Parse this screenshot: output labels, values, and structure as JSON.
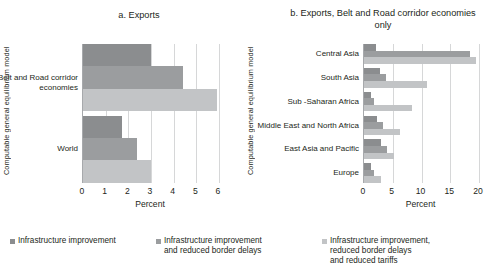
{
  "figure": {
    "yaxis_title": "Computable general equilibrium model"
  },
  "panels": [
    {
      "title": "a. Exports",
      "xlabel": "Percent",
      "ticks": [
        "0",
        "1",
        "2",
        "3",
        "4",
        "5",
        "6"
      ],
      "categories": [
        "Belt and\nRoad corridor\neconomies",
        "World"
      ]
    },
    {
      "title": "b. Exports, Belt and Road\ncorridor economies only",
      "xlabel": "Percent",
      "ticks": [
        "0",
        "5",
        "10",
        "15",
        "20"
      ],
      "categories": [
        "Central Asia",
        "South Asia",
        "Sub -Saharan  Africa",
        "Middle East\nand North Africa",
        "East Asia and Pacific",
        "Europe"
      ]
    }
  ],
  "legend": [
    {
      "label": "Infrastructure improvement",
      "color": "#8b8d8f"
    },
    {
      "label": "Infrastructure improvement\nand reduced border delays",
      "color": "#9b9d9f"
    },
    {
      "label": "Infrastructure improvement,\nreduced border delays\nand reduced tariffs",
      "color": "#c2c4c6"
    }
  ],
  "chart_data": [
    {
      "type": "bar",
      "orientation": "horizontal",
      "title": "a. Exports",
      "xlabel": "Percent",
      "ylabel": "Computable general equilibrium model",
      "xlim": [
        0,
        6
      ],
      "xticks": [
        0,
        1,
        2,
        3,
        4,
        5,
        6
      ],
      "grid": "vertical",
      "legend_position": "bottom",
      "categories": [
        "Belt and Road corridor economies",
        "World"
      ],
      "series": [
        {
          "name": "Infrastructure improvement",
          "color": "#8b8d8f",
          "values": [
            3.0,
            1.7
          ]
        },
        {
          "name": "Infrastructure improvement and reduced border delays",
          "color": "#9b9d9f",
          "values": [
            4.4,
            2.4
          ]
        },
        {
          "name": "Infrastructure improvement, reduced border delays and reduced tariffs",
          "color": "#c2c4c6",
          "values": [
            5.9,
            3.0
          ]
        }
      ]
    },
    {
      "type": "bar",
      "orientation": "horizontal",
      "title": "b. Exports, Belt and Road corridor economies only",
      "xlabel": "Percent",
      "ylabel": "Computable general equilibrium model",
      "xlim": [
        0,
        20
      ],
      "xticks": [
        0,
        5,
        10,
        15,
        20
      ],
      "grid": "vertical",
      "legend_position": "bottom",
      "categories": [
        "Central Asia",
        "South Asia",
        "Sub -Saharan  Africa",
        "Middle East and North Africa",
        "East Asia and Pacific",
        "Europe"
      ],
      "series": [
        {
          "name": "Infrastructure improvement",
          "color": "#8b8d8f",
          "values": [
            2.0,
            2.8,
            1.3,
            2.3,
            3.0,
            1.3
          ]
        },
        {
          "name": "Infrastructure improvement and reduced border delays",
          "color": "#9b9d9f",
          "values": [
            18.5,
            3.8,
            1.7,
            3.3,
            4.0,
            1.7
          ]
        },
        {
          "name": "Infrastructure improvement, reduced border delays and reduced tariffs",
          "color": "#c2c4c6",
          "values": [
            19.5,
            11.0,
            8.3,
            6.2,
            5.3,
            3.0
          ]
        }
      ]
    }
  ]
}
